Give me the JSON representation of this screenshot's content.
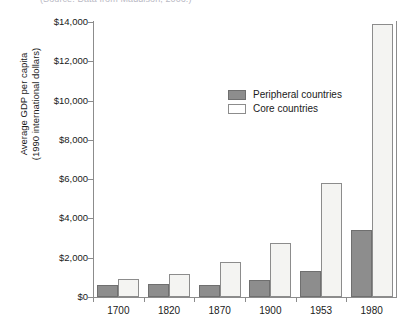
{
  "caption": {
    "source_text": "(Source: Data from Maddison, 2006.)"
  },
  "chart_data": {
    "type": "bar",
    "title": "",
    "xlabel": "",
    "ylabel": "Average GDP per capita (1990 international dollars)",
    "ylabel_line1": "Average GDP per capita",
    "ylabel_line2": "(1990 international dollars)",
    "categories": [
      "1700",
      "1820",
      "1870",
      "1900",
      "1953",
      "1980"
    ],
    "series": [
      {
        "name": "Peripheral countries",
        "color": "#8d8d8d",
        "values": [
          600,
          650,
          620,
          850,
          1300,
          3400
        ]
      },
      {
        "name": "Core countries",
        "color": "#f4f4f2",
        "values": [
          900,
          1150,
          1800,
          2750,
          5800,
          13900
        ]
      }
    ],
    "ylim": [
      0,
      14000
    ],
    "ytick_values": [
      0,
      2000,
      4000,
      6000,
      8000,
      10000,
      12000,
      14000
    ],
    "ytick_labels": [
      "$0",
      "$2,000",
      "$4,000",
      "$6,000",
      "$8,000",
      "$10,000",
      "$12,000",
      "$14,000"
    ],
    "grid": false,
    "legend_position": "upper-center-right",
    "legend": [
      "Peripheral countries",
      "Core countries"
    ]
  }
}
